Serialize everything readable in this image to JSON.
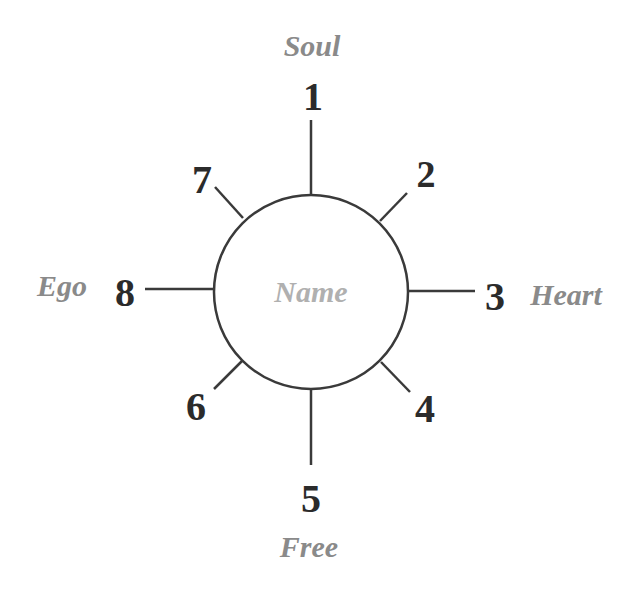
{
  "diagram": {
    "center_label": "Name",
    "colors": {
      "line": "#3a3a3a",
      "number": "#2b2b2b",
      "label": "#8a8a8a",
      "center_label": "#b0b0b0"
    },
    "positions": [
      {
        "number": "1",
        "label": "Soul"
      },
      {
        "number": "2",
        "label": ""
      },
      {
        "number": "3",
        "label": "Heart"
      },
      {
        "number": "4",
        "label": ""
      },
      {
        "number": "5",
        "label": "Free"
      },
      {
        "number": "6",
        "label": ""
      },
      {
        "number": "7",
        "label": ""
      },
      {
        "number": "8",
        "label": "Ego"
      }
    ]
  }
}
